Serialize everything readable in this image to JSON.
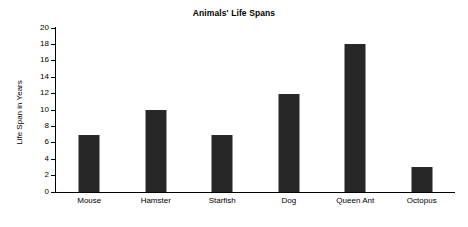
{
  "chart_data": {
    "type": "bar",
    "title": "Animals' Life Spans",
    "xlabel": "",
    "ylabel": "Life Span in Years",
    "categories": [
      "Mouse",
      "Hamster",
      "Starfish",
      "Dog",
      "Queen Ant",
      "Octopus"
    ],
    "values": [
      7,
      10,
      7,
      12,
      18,
      3
    ],
    "ylim": [
      0,
      20
    ],
    "ytick_step": 2,
    "yticks": [
      0,
      2,
      4,
      6,
      8,
      10,
      12,
      14,
      16,
      18,
      20
    ],
    "grid": false,
    "legend": false,
    "bar_color": "#272727",
    "background_color": "#ffffff",
    "axis_color": "#000000"
  }
}
